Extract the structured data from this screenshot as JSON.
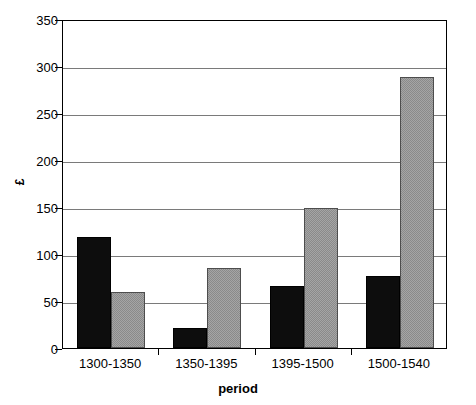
{
  "chart_data": {
    "type": "bar",
    "title": "",
    "xlabel": "period",
    "ylabel": "£",
    "categories": [
      "1300-1350",
      "1350-1395",
      "1395-1500",
      "1500-1540"
    ],
    "series": [
      {
        "name": "series-1",
        "color": "#0d0d0d",
        "values": [
          118,
          21,
          66,
          77
        ]
      },
      {
        "name": "series-2",
        "color": "#a5a5a5",
        "values": [
          60,
          85,
          149,
          288
        ]
      }
    ],
    "ylim": [
      0,
      350
    ],
    "ytick_values": [
      0,
      50,
      100,
      150,
      200,
      250,
      300,
      350
    ],
    "ytick_labels": [
      "0",
      "50",
      "100",
      "150",
      "200",
      "250",
      "300",
      "350"
    ],
    "grid": "horizontal",
    "legend": "none"
  }
}
